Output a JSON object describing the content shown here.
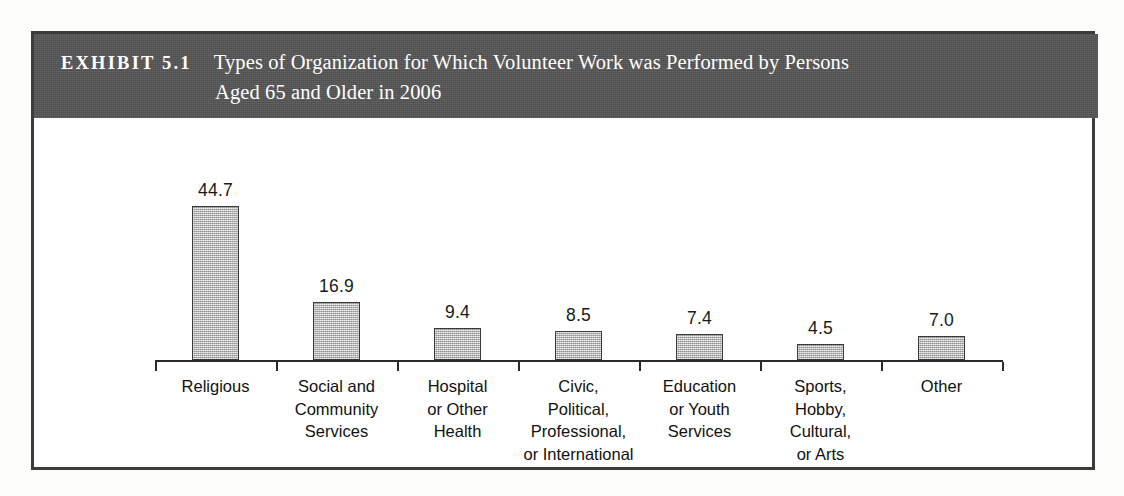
{
  "exhibit": {
    "number_label": "EXHIBIT 5.1",
    "title_line_1": "Types of Organization for Which Volunteer Work was Performed by Persons",
    "title_line_2": "Aged 65 and Older in 2006",
    "header_bg": "#565656",
    "frame_border": "#3b3b3b",
    "bar_fill": "#b4b4b4",
    "bar_outline": "#3a3a3a"
  },
  "chart_data": {
    "type": "bar",
    "title": "Types of Organization for Which Volunteer Work was Performed by Persons Aged 65 and Older in 2006",
    "xlabel": "",
    "ylabel": "",
    "ylim": [
      0,
      50
    ],
    "grid": false,
    "legend": "none",
    "axis": "x-axis baseline only, with category boundary ticks",
    "categories": [
      "Religious",
      "Social and Community Services",
      "Hospital or Other Health",
      "Civic, Political, Professional, or International",
      "Education or Youth Services",
      "Sports, Hobby, Cultural, or Arts",
      "Other"
    ],
    "category_lines": [
      [
        "Religious"
      ],
      [
        "Social and",
        "Community",
        "Services"
      ],
      [
        "Hospital",
        "or Other",
        "Health"
      ],
      [
        "Civic,",
        "Political,",
        "Professional,",
        "or International"
      ],
      [
        "Education",
        "or Youth",
        "Services"
      ],
      [
        "Sports,",
        "Hobby,",
        "Cultural,",
        "or Arts"
      ],
      [
        "Other"
      ]
    ],
    "values": [
      44.7,
      16.9,
      9.4,
      8.5,
      7.4,
      4.5,
      7.0
    ],
    "value_labels": [
      "44.7",
      "16.9",
      "9.4",
      "8.5",
      "7.4",
      "4.5",
      "7.0"
    ]
  }
}
